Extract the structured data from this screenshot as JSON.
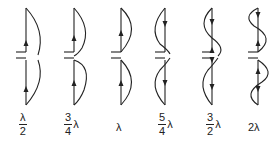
{
  "antennas": [
    {
      "id": "half-wave",
      "label_num": "λ",
      "label_den": "2",
      "label_suffix": ""
    },
    {
      "id": "three-quarter-wave",
      "label_num": "3",
      "label_den": "4",
      "label_suffix": "λ"
    },
    {
      "id": "full-wave",
      "label_text": "λ"
    },
    {
      "id": "five-quarter-wave",
      "label_num": "5",
      "label_den": "4",
      "label_suffix": "λ"
    },
    {
      "id": "three-half-wave",
      "label_num": "3",
      "label_den": "2",
      "label_suffix": "λ"
    },
    {
      "id": "two-wave",
      "label_text": "2λ"
    }
  ],
  "colors": {
    "line": "#222222",
    "background": "#ffffff"
  }
}
